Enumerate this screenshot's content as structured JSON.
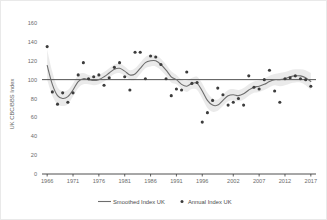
{
  "chart_data": {
    "type": "scatter",
    "title": "",
    "xlabel": "",
    "ylabel": "UK CBC/BBS Index",
    "xlim": [
      1965,
      2018
    ],
    "ylim": [
      0,
      160
    ],
    "grid": false,
    "legend_position": "bottom",
    "y_ticks": [
      0,
      20,
      40,
      60,
      80,
      100,
      120,
      140,
      160
    ],
    "x_ticks": [
      1966,
      1971,
      1976,
      1981,
      1986,
      1991,
      1996,
      2002,
      2007,
      2012,
      2017
    ],
    "reference_line": {
      "value": 100,
      "label": ""
    },
    "series": [
      {
        "name": "Annual Index UK",
        "type": "scatter",
        "marker": "circle",
        "color": "#3c3c3c",
        "x": [
          1966,
          1967,
          1968,
          1969,
          1970,
          1971,
          1972,
          1973,
          1974,
          1975,
          1976,
          1977,
          1978,
          1979,
          1980,
          1981,
          1982,
          1983,
          1984,
          1985,
          1986,
          1987,
          1988,
          1989,
          1990,
          1991,
          1992,
          1993,
          1994,
          1995,
          1996,
          1997,
          1998,
          1999,
          2000,
          2001,
          2002,
          2003,
          2004,
          2005,
          2006,
          2007,
          2008,
          2009,
          2010,
          2011,
          2012,
          2013,
          2014,
          2015,
          2016,
          2017
        ],
        "values": [
          135,
          87,
          74,
          86,
          76,
          86,
          105,
          118,
          101,
          103,
          105,
          94,
          102,
          113,
          118,
          103,
          89,
          129,
          129,
          101,
          125,
          124,
          116,
          101,
          83,
          90,
          89,
          108,
          96,
          97,
          55,
          65,
          78,
          91,
          84,
          73,
          76,
          80,
          73,
          104,
          92,
          90,
          100,
          110,
          88,
          76,
          101,
          102,
          104,
          101,
          100,
          93
        ]
      },
      {
        "name": "Smoothed Index UK",
        "type": "line",
        "color": "#6d6d6d",
        "x": [
          1966,
          1967,
          1968,
          1969,
          1970,
          1971,
          1972,
          1973,
          1974,
          1975,
          1976,
          1977,
          1978,
          1979,
          1980,
          1981,
          1982,
          1983,
          1984,
          1985,
          1986,
          1987,
          1988,
          1989,
          1990,
          1991,
          1992,
          1993,
          1994,
          1995,
          1996,
          1997,
          1998,
          1999,
          2000,
          2001,
          2002,
          2003,
          2004,
          2005,
          2006,
          2007,
          2008,
          2009,
          2010,
          2011,
          2012,
          2013,
          2014,
          2015,
          2016,
          2017
        ],
        "values": [
          115,
          95,
          83,
          80,
          82,
          89,
          98,
          101,
          100,
          99,
          100,
          103,
          107,
          111,
          112,
          109,
          105,
          106,
          112,
          118,
          120,
          120,
          116,
          110,
          103,
          100,
          95,
          93,
          96,
          96,
          88,
          78,
          73,
          73,
          78,
          83,
          84,
          83,
          85,
          89,
          92,
          93,
          95,
          98,
          100,
          100,
          101,
          103,
          104,
          104,
          102,
          98
        ],
        "confidence_band": {
          "upper": [
            132,
            108,
            92,
            88,
            89,
            96,
            105,
            107,
            105,
            104,
            105,
            108,
            112,
            116,
            117,
            114,
            110,
            112,
            118,
            124,
            126,
            126,
            122,
            116,
            109,
            105,
            100,
            99,
            102,
            103,
            96,
            86,
            80,
            79,
            84,
            89,
            90,
            89,
            91,
            95,
            98,
            99,
            101,
            104,
            106,
            107,
            108,
            110,
            111,
            111,
            110,
            107
          ],
          "lower": [
            100,
            83,
            74,
            72,
            74,
            82,
            91,
            95,
            95,
            94,
            95,
            98,
            102,
            106,
            107,
            104,
            100,
            100,
            106,
            112,
            114,
            114,
            110,
            104,
            97,
            95,
            90,
            87,
            90,
            89,
            80,
            70,
            66,
            67,
            72,
            77,
            78,
            77,
            79,
            83,
            86,
            87,
            89,
            92,
            94,
            93,
            94,
            96,
            97,
            97,
            94,
            89
          ]
        }
      }
    ],
    "legend": [
      {
        "label": "Smoothed Index UK",
        "marker": "line",
        "color": "#6d6d6d"
      },
      {
        "label": "Annual Index UK",
        "marker": "dot",
        "color": "#3c3c3c"
      }
    ]
  }
}
